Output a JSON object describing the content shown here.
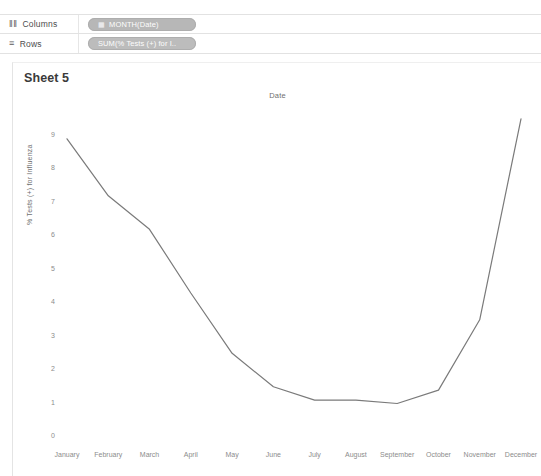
{
  "shelves": [
    {
      "name": "columns",
      "icon": "columns-icon",
      "glyph": "‖‖",
      "label": "Columns",
      "pill": {
        "icon": "calendar-icon",
        "glyph": "▦",
        "label": "MONTH(Date)"
      }
    },
    {
      "name": "rows",
      "icon": "rows-icon",
      "glyph": "≡",
      "label": "Rows",
      "pill": {
        "icon": "measure-icon",
        "glyph": "",
        "label": "SUM(% Tests (+) for I.."
      }
    }
  ],
  "sheet": {
    "title": "Sheet 5"
  },
  "chart_data": {
    "type": "line",
    "title": "Date",
    "xlabel": "",
    "ylabel": "% Tests (+) for Influenza",
    "categories": [
      "January",
      "February",
      "March",
      "April",
      "May",
      "June",
      "July",
      "August",
      "September",
      "October",
      "November",
      "December"
    ],
    "values": [
      8.9,
      7.2,
      6.2,
      4.3,
      2.5,
      1.5,
      1.1,
      1.1,
      1.0,
      1.4,
      3.5,
      9.5
    ],
    "ylim": [
      0,
      9
    ],
    "yticks": [
      0,
      1,
      2,
      3,
      4,
      5,
      6,
      7,
      8,
      9
    ],
    "ytick_labels": [
      "0",
      "1",
      "2",
      "3",
      "4",
      "5",
      "6",
      "7",
      "8",
      "9"
    ],
    "grid": false,
    "legend": "none",
    "line_color": "#7a7a7a",
    "line_width": 1.2
  }
}
